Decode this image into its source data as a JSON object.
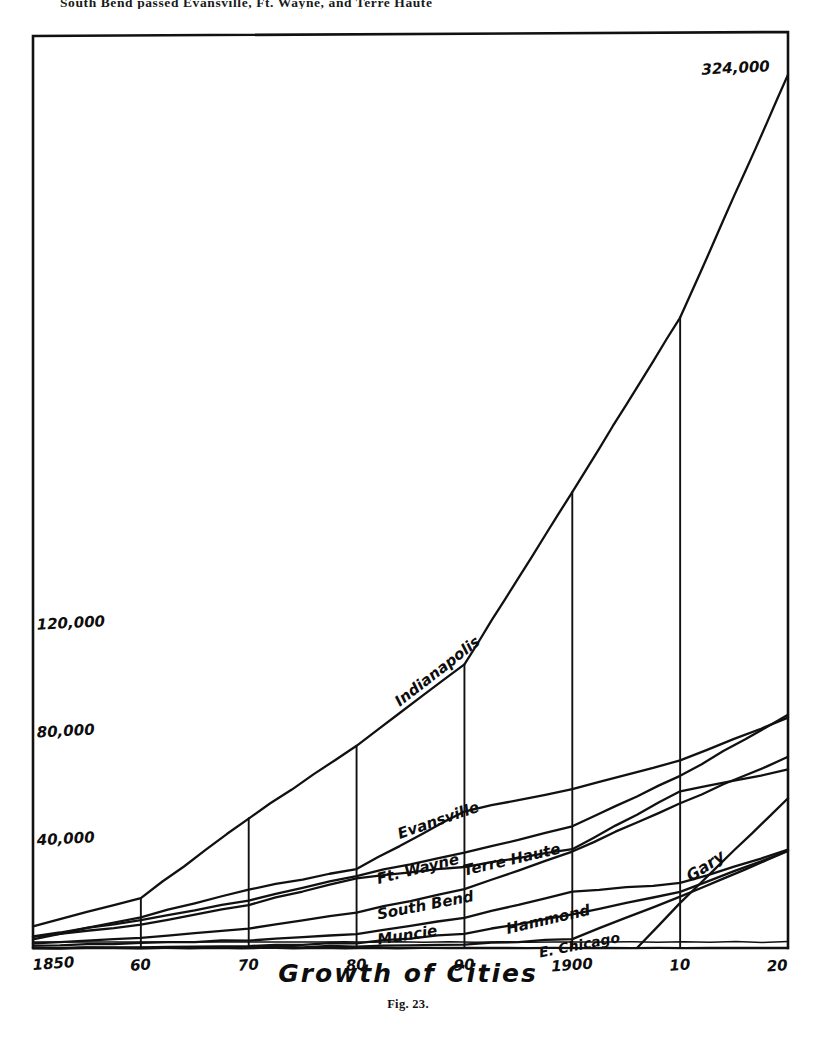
{
  "page": {
    "top_running_text": "South Bend passed Evansville, Ft. Wayne, and Terre Haute",
    "caption": "Fig. 23."
  },
  "chart_data": {
    "type": "line",
    "title": "Growth of Cities",
    "xlabel": "",
    "ylabel": "",
    "grid": true,
    "legend_position": "inline-labels",
    "xlim": [
      1850,
      1920
    ],
    "ylim": [
      0,
      340000
    ],
    "x_tick_labels": [
      "1850",
      "60",
      "70",
      "80",
      "90",
      "1900",
      "10",
      "20"
    ],
    "x_tick_values": [
      1850,
      1860,
      1870,
      1880,
      1890,
      1900,
      1910,
      1920
    ],
    "y_tick_labels": [
      "40,000",
      "80,000",
      "120,000"
    ],
    "y_tick_values": [
      40000,
      80000,
      120000
    ],
    "annotations": [
      {
        "text": "324,000",
        "x": 1920,
        "y": 324000,
        "note": "Indianapolis 1920 population"
      }
    ],
    "series": [
      {
        "name": "Indianapolis",
        "label": "Indianapolis",
        "x": [
          1850,
          1860,
          1870,
          1880,
          1890,
          1900,
          1910,
          1920
        ],
        "values": [
          8000,
          18600,
          48200,
          75100,
          105400,
          169200,
          234000,
          324000
        ]
      },
      {
        "name": "Evansville",
        "label": "Evansville",
        "x": [
          1850,
          1860,
          1870,
          1880,
          1890,
          1900,
          1910,
          1920
        ],
        "values": [
          3200,
          11500,
          21800,
          29300,
          50800,
          59000,
          69600,
          85300
        ]
      },
      {
        "name": "Ft. Wayne",
        "label": "Ft. Wayne",
        "x": [
          1850,
          1860,
          1870,
          1880,
          1890,
          1900,
          1910,
          1920
        ],
        "values": [
          4300,
          10400,
          17700,
          26900,
          35400,
          45100,
          63900,
          86500
        ]
      },
      {
        "name": "Terre Haute",
        "label": "Terre Haute",
        "x": [
          1850,
          1860,
          1870,
          1880,
          1890,
          1900,
          1910,
          1920
        ],
        "values": [
          4100,
          8600,
          16100,
          26000,
          30200,
          36700,
          58200,
          66100
        ]
      },
      {
        "name": "South Bend",
        "label": "South Bend",
        "x": [
          1850,
          1860,
          1870,
          1880,
          1890,
          1900,
          1910,
          1920
        ],
        "values": [
          1700,
          3800,
          7200,
          13300,
          21800,
          35900,
          53700,
          70900
        ]
      },
      {
        "name": "Muncie",
        "label": "Muncie",
        "x": [
          1850,
          1860,
          1870,
          1880,
          1890,
          1900,
          1910,
          1920
        ],
        "values": [
          900,
          1800,
          2900,
          5200,
          11300,
          20900,
          24000,
          36500
        ]
      },
      {
        "name": "Hammond",
        "label": "Hammond",
        "x": [
          1850,
          1860,
          1870,
          1880,
          1890,
          1900,
          1910,
          1920
        ],
        "values": [
          0,
          300,
          700,
          1900,
          5400,
          12400,
          20900,
          36000
        ]
      },
      {
        "name": "E. Chicago",
        "label": "E. Chicago",
        "x": [
          1850,
          1860,
          1870,
          1880,
          1890,
          1900,
          1910,
          1920
        ],
        "values": [
          0,
          0,
          200,
          700,
          1300,
          3400,
          19000,
          35900
        ]
      },
      {
        "name": "Gary",
        "label": "Gary",
        "x": [
          1906,
          1910,
          1920
        ],
        "values": [
          0,
          16800,
          55400
        ]
      }
    ]
  }
}
